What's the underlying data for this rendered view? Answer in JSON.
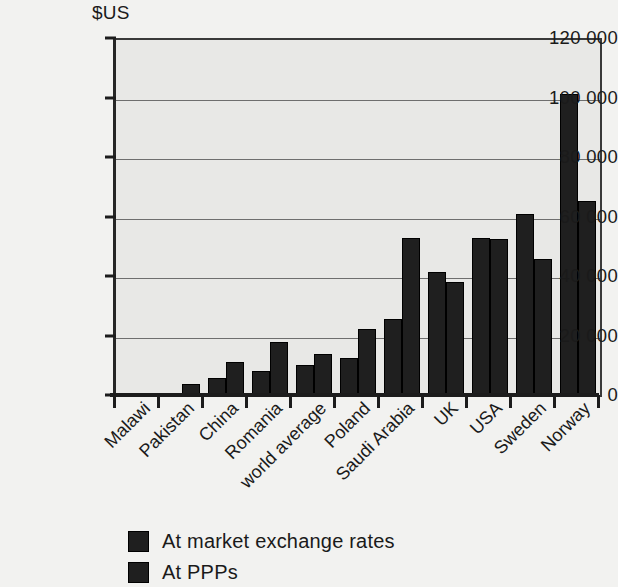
{
  "chart_data": {
    "type": "bar",
    "title": "",
    "subtitle": "",
    "unit_label": "$US",
    "xlabel": "",
    "ylabel": "$US",
    "ylim": [
      0,
      120000
    ],
    "ytick_values": [
      0,
      20000,
      40000,
      60000,
      80000,
      100000,
      120000
    ],
    "ytick_labels": [
      "0",
      "20 000",
      "40 000",
      "60 000",
      "80 000",
      "100 000",
      "120 000"
    ],
    "grid": "horizontal",
    "legend_position": "below-axis-left",
    "categories": [
      "Malawi",
      "Pakistan",
      "China",
      "Romania",
      "world average",
      "Poland",
      "Saudi Arabia",
      "UK",
      "USA",
      "Sweden",
      "Norway"
    ],
    "series": [
      {
        "name": "At market exchange rates",
        "color": "#1f1f1f",
        "values": [
          600,
          1100,
          6300,
          8800,
          10800,
          13000,
          26300,
          42000,
          53500,
          61500,
          102000
        ]
      },
      {
        "name": "At PPPs",
        "color": "#1f1f1f",
        "values": [
          800,
          4500,
          11800,
          18500,
          14300,
          23000,
          53500,
          38500,
          53000,
          46500,
          66000
        ]
      }
    ],
    "plot_background": "#e8e8e6",
    "page_background": "#f2f2f0",
    "axis_color": "#1c1c1c",
    "gridline_color": "#6e6e6e"
  },
  "legend": {
    "items": [
      {
        "label": "At market exchange rates"
      },
      {
        "label": "At PPPs"
      }
    ]
  }
}
